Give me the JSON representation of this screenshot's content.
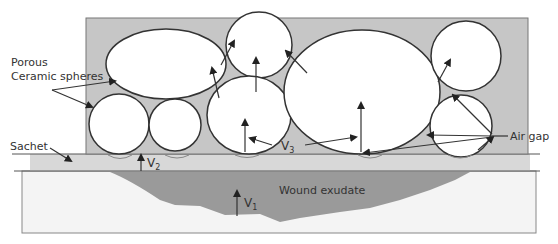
{
  "diagram": {
    "labels": {
      "porous_line1": "Porous",
      "porous_line2": "Ceramic spheres",
      "sachet": "Sachet",
      "air_gap": "Air gap",
      "wound_exudate": "Wound exudate",
      "v1": "V",
      "v1_sub": "1",
      "v2": "V",
      "v2_sub": "2",
      "v3": "V",
      "v3_sub": "3"
    },
    "colors": {
      "container_fill": "#c6c6c6",
      "sachet_fill": "#d8d8d8",
      "exudate_fill": "#9a9a9a",
      "wound_bed_fill": "#f4f4f4",
      "sphere_fill": "#ffffff",
      "stroke": "#333333"
    }
  }
}
